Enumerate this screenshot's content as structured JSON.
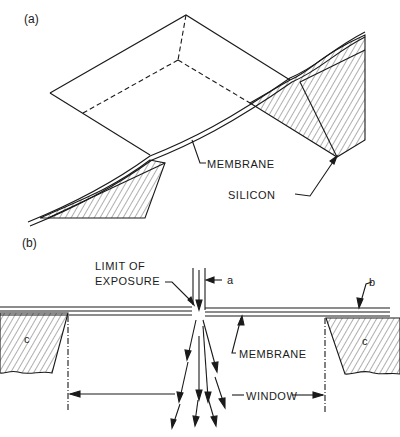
{
  "figure": {
    "panel_a": {
      "label": "(a)",
      "callouts": {
        "membrane": "MEMBRANE",
        "silicon": "SILICON"
      }
    },
    "panel_b": {
      "label": "(b)",
      "callouts": {
        "limit_line1": "LIMIT OF",
        "limit_line2": "EXPOSURE",
        "a": "a",
        "b": "b",
        "c_left": "c",
        "c_right": "c",
        "membrane": "MEMBRANE",
        "window": "WINDOW"
      }
    },
    "colors": {
      "ink": "#1a1a1a",
      "background": "#ffffff"
    }
  }
}
